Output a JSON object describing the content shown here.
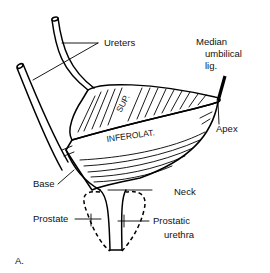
{
  "figure": {
    "panel_label": "A.",
    "colors": {
      "line": "#000000",
      "background": "#ffffff",
      "text": "#111111"
    }
  },
  "labels": {
    "ureters": "Ureters",
    "median_umbilical_line1": "Median",
    "median_umbilical_line2": "umbilical",
    "median_umbilical_line3": "lig.",
    "apex": "Apex",
    "sup": "SUP.",
    "inferolat": "INFEROLAT.",
    "base": "Base",
    "neck": "Neck",
    "prostate": "Prostate",
    "prostatic_urethra_line1": "Prostatic",
    "prostatic_urethra_line2": "urethra"
  }
}
